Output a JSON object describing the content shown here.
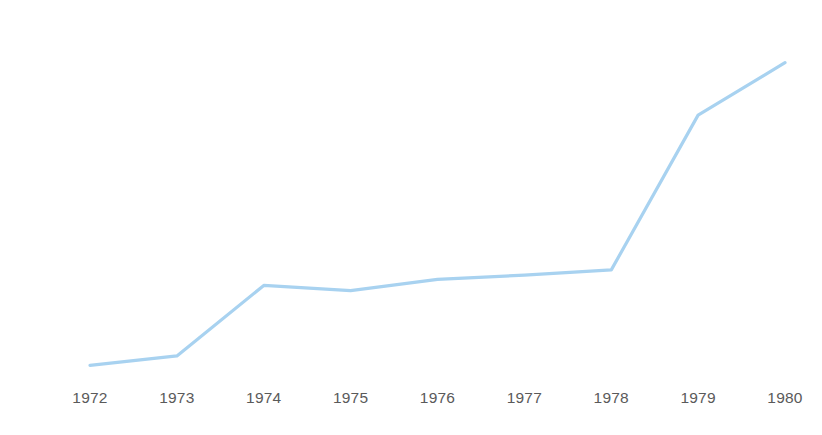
{
  "chart_data": {
    "type": "line",
    "title": "",
    "subtitle": "",
    "xlabel": "",
    "ylabel": "",
    "categories": [
      "1972",
      "1973",
      "1974",
      "1975",
      "1976",
      "1977",
      "1978",
      "1979",
      "1980"
    ],
    "values": [
      1.7,
      2.8,
      11.0,
      10.4,
      11.7,
      12.2,
      12.8,
      30.8,
      36.9
    ],
    "series": [
      {
        "name": "",
        "values": [
          1.7,
          2.8,
          11.0,
          10.4,
          11.7,
          12.2,
          12.8,
          30.8,
          36.9
        ],
        "color": "#a8d2f0"
      }
    ],
    "ylim": [
      0,
      40
    ],
    "y_ticks": [
      0,
      5,
      10,
      15,
      20,
      25,
      30,
      35,
      40
    ],
    "y_tick_labels": [
      "0",
      "5",
      "10",
      "15",
      "20",
      "25",
      "30",
      "35",
      "40"
    ],
    "x_tick_labels": [
      "1972",
      "1973",
      "1974",
      "1975",
      "1976",
      "1977",
      "1978",
      "1979",
      "1980"
    ],
    "grid": false,
    "legend": "none",
    "axis_lines": false,
    "markers": false
  },
  "style": {
    "line_color": "#a8d2f0",
    "line_width": 3.2,
    "text_color": "#5a5a5a",
    "background": "#ffffff"
  },
  "geometry": {
    "plot_left": 90,
    "plot_right": 785,
    "y_zero_px": 380,
    "px_per_unit": 8.6,
    "y_label_right": 47,
    "x_label_top": 390
  }
}
